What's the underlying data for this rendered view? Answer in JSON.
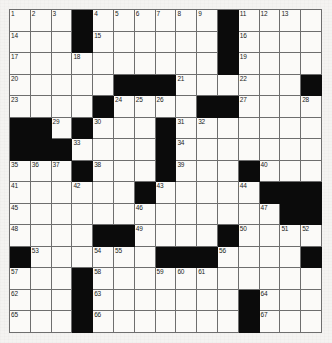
{
  "puzzle": {
    "title": "Crossword Grid",
    "kind": "crossword-grid",
    "rows": 15,
    "cols": 15,
    "colors": {
      "block": "#0b0b0b",
      "cell": "#fbfaf8",
      "gridline": "#6e6e6e",
      "paper": "#f4f3f1",
      "number_text": "#1a1a1a"
    },
    "grid": [
      ".........#....#...........#....",
      "OOO#OOOOOOO#OOO",
      "OOO#OOOOOOO#OOO",
      "OOOOOOOOOOO#OOO",
      "OOOOO###OOOOO#O",
      "OOOO#OOOO##OOOO",
      "##O#OOOO#OOOOOO",
      "###OOOO#OOOOOOO",
      "OOO#OOO#OOO#OOO",
      "OOO#OO#OOOO#OOO",
      "OOOOOOOOOOOO###",
      "OOOO##OOOO#OOOO",
      "#OOO#OO###OOOOO",
      "OOO#OOOOOOOOOOO",
      "OOO#OOOOOOO#OOO"
    ],
    "blocks": [
      [
        0,
        3
      ],
      [
        0,
        10
      ],
      [
        1,
        3
      ],
      [
        1,
        10
      ],
      [
        2,
        10
      ],
      [
        3,
        5
      ],
      [
        3,
        6
      ],
      [
        3,
        7
      ],
      [
        3,
        14
      ],
      [
        4,
        4
      ],
      [
        4,
        9
      ],
      [
        4,
        10
      ],
      [
        5,
        0
      ],
      [
        5,
        1
      ],
      [
        5,
        3
      ],
      [
        5,
        7
      ],
      [
        6,
        0
      ],
      [
        6,
        1
      ],
      [
        6,
        2
      ],
      [
        6,
        7
      ],
      [
        7,
        3
      ],
      [
        7,
        7
      ],
      [
        7,
        11
      ],
      [
        8,
        6
      ],
      [
        8,
        12
      ],
      [
        8,
        13
      ],
      [
        8,
        14
      ],
      [
        9,
        13
      ],
      [
        9,
        14
      ],
      [
        10,
        4
      ],
      [
        10,
        5
      ],
      [
        10,
        10
      ],
      [
        11,
        0
      ],
      [
        11,
        7
      ],
      [
        11,
        8
      ],
      [
        11,
        9
      ],
      [
        11,
        14
      ],
      [
        12,
        3
      ],
      [
        13,
        3
      ],
      [
        13,
        11
      ],
      [
        14,
        3
      ],
      [
        14,
        11
      ]
    ],
    "numbers": [
      {
        "r": 0,
        "c": 0,
        "n": "1"
      },
      {
        "r": 0,
        "c": 1,
        "n": "2"
      },
      {
        "r": 0,
        "c": 2,
        "n": "3"
      },
      {
        "r": 0,
        "c": 4,
        "n": "4"
      },
      {
        "r": 0,
        "c": 5,
        "n": "5"
      },
      {
        "r": 0,
        "c": 6,
        "n": "6"
      },
      {
        "r": 0,
        "c": 7,
        "n": "7"
      },
      {
        "r": 0,
        "c": 8,
        "n": "8"
      },
      {
        "r": 0,
        "c": 9,
        "n": "9"
      },
      {
        "r": 0,
        "c": 10,
        "n": "10"
      },
      {
        "r": 0,
        "c": 11,
        "n": "11"
      },
      {
        "r": 0,
        "c": 12,
        "n": "12"
      },
      {
        "r": 0,
        "c": 13,
        "n": "13"
      },
      {
        "r": 1,
        "c": 0,
        "n": "14"
      },
      {
        "r": 1,
        "c": 4,
        "n": "15"
      },
      {
        "r": 1,
        "c": 11,
        "n": "16"
      },
      {
        "r": 2,
        "c": 0,
        "n": "17"
      },
      {
        "r": 2,
        "c": 3,
        "n": "18"
      },
      {
        "r": 2,
        "c": 11,
        "n": "19"
      },
      {
        "r": 3,
        "c": 0,
        "n": "20"
      },
      {
        "r": 3,
        "c": 8,
        "n": "21"
      },
      {
        "r": 3,
        "c": 11,
        "n": "22"
      },
      {
        "r": 4,
        "c": 0,
        "n": "23"
      },
      {
        "r": 4,
        "c": 5,
        "n": "24"
      },
      {
        "r": 4,
        "c": 6,
        "n": "25"
      },
      {
        "r": 4,
        "c": 7,
        "n": "26"
      },
      {
        "r": 4,
        "c": 11,
        "n": "27"
      },
      {
        "r": 4,
        "c": 14,
        "n": "28"
      },
      {
        "r": 5,
        "c": 2,
        "n": "29"
      },
      {
        "r": 5,
        "c": 4,
        "n": "30"
      },
      {
        "r": 5,
        "c": 8,
        "n": "31"
      },
      {
        "r": 5,
        "c": 9,
        "n": "32"
      },
      {
        "r": 6,
        "c": 3,
        "n": "33"
      },
      {
        "r": 6,
        "c": 8,
        "n": "34"
      },
      {
        "r": 7,
        "c": 0,
        "n": "35"
      },
      {
        "r": 7,
        "c": 1,
        "n": "36"
      },
      {
        "r": 7,
        "c": 2,
        "n": "37"
      },
      {
        "r": 7,
        "c": 4,
        "n": "38"
      },
      {
        "r": 7,
        "c": 8,
        "n": "39"
      },
      {
        "r": 7,
        "c": 12,
        "n": "40"
      },
      {
        "r": 8,
        "c": 0,
        "n": "41"
      },
      {
        "r": 8,
        "c": 3,
        "n": "42"
      },
      {
        "r": 8,
        "c": 7,
        "n": "43"
      },
      {
        "r": 8,
        "c": 11,
        "n": "44"
      },
      {
        "r": 9,
        "c": 0,
        "n": "45"
      },
      {
        "r": 9,
        "c": 6,
        "n": "46"
      },
      {
        "r": 9,
        "c": 12,
        "n": "47"
      },
      {
        "r": 10,
        "c": 0,
        "n": "48"
      },
      {
        "r": 10,
        "c": 6,
        "n": "49"
      },
      {
        "r": 10,
        "c": 11,
        "n": "50"
      },
      {
        "r": 10,
        "c": 13,
        "n": "51"
      },
      {
        "r": 10,
        "c": 14,
        "n": "52"
      },
      {
        "r": 11,
        "c": 1,
        "n": "53"
      },
      {
        "r": 11,
        "c": 4,
        "n": "54"
      },
      {
        "r": 11,
        "c": 5,
        "n": "55"
      },
      {
        "r": 11,
        "c": 10,
        "n": "56"
      },
      {
        "r": 12,
        "c": 0,
        "n": "57"
      },
      {
        "r": 12,
        "c": 4,
        "n": "58"
      },
      {
        "r": 12,
        "c": 7,
        "n": "59"
      },
      {
        "r": 12,
        "c": 8,
        "n": "60"
      },
      {
        "r": 12,
        "c": 9,
        "n": "61"
      },
      {
        "r": 13,
        "c": 0,
        "n": "62"
      },
      {
        "r": 13,
        "c": 4,
        "n": "63"
      },
      {
        "r": 13,
        "c": 12,
        "n": "64"
      },
      {
        "r": 14,
        "c": 0,
        "n": "65"
      },
      {
        "r": 14,
        "c": 4,
        "n": "66"
      },
      {
        "r": 14,
        "c": 12,
        "n": "67"
      }
    ],
    "entries": []
  }
}
